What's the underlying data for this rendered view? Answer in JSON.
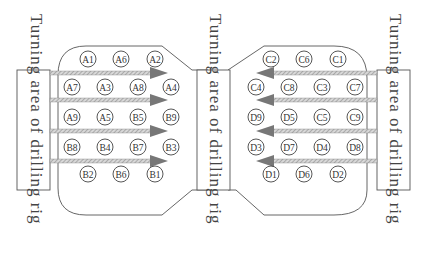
{
  "labels": {
    "left": "Turning area of drilling rig",
    "middle": "Turning area of drilling rig",
    "right": "Turning area of drilling rig"
  },
  "colors": {
    "outline": "#555555",
    "arrow": "#7a7a7a",
    "hatch": "#9a9a9a",
    "text": "#333333"
  },
  "left_block": {
    "rows": [
      [
        "A1",
        "A6",
        "A2"
      ],
      [
        "A7",
        "A3",
        "A8",
        "A4"
      ],
      [
        "A9",
        "A5",
        "B5",
        "B9"
      ],
      [
        "B8",
        "B4",
        "B7",
        "B3"
      ],
      [
        "B2",
        "B6",
        "B1"
      ]
    ],
    "arrow_direction": "right",
    "arrow_count": 4
  },
  "right_block": {
    "rows": [
      [
        "C2",
        "C6",
        "C1"
      ],
      [
        "C4",
        "C8",
        "C3",
        "C7"
      ],
      [
        "D9",
        "D5",
        "C5",
        "C9"
      ],
      [
        "D3",
        "D7",
        "D4",
        "D8"
      ],
      [
        "D1",
        "D6",
        "D2"
      ]
    ],
    "arrow_direction": "left",
    "arrow_count": 4
  }
}
